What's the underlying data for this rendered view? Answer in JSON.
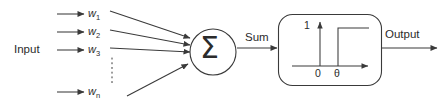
{
  "diagram": {
    "input_label": "Input",
    "sum_label": "Sum",
    "output_label": "Output",
    "sigma_symbol": "Σ",
    "weights": [
      {
        "name": "w",
        "subscript": "1"
      },
      {
        "name": "w",
        "subscript": "2"
      },
      {
        "name": "w",
        "subscript": "3"
      },
      {
        "name": "w",
        "subscript": "n"
      }
    ],
    "activation_plot": {
      "type": "step",
      "y_tick_label": "1",
      "origin_label": "0",
      "threshold_label": "θ"
    },
    "colors": {
      "background": "#ffffff",
      "stroke": "#3a3a3a",
      "text": "#2b2b2b"
    }
  }
}
